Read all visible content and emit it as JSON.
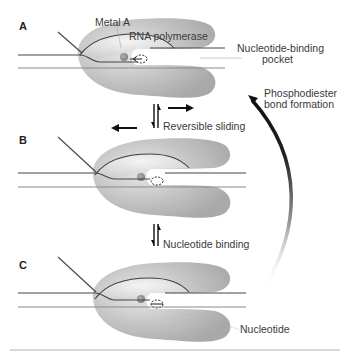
{
  "panels": [
    {
      "letter": "A",
      "state": "pre-translocated"
    },
    {
      "letter": "B",
      "state": "translocated"
    },
    {
      "letter": "C",
      "state": "nucleotide-bound"
    }
  ],
  "labels": {
    "metal_a": "Metal A",
    "rna_polymerase": "RNA polymerase",
    "nucleotide_binding_pocket_line1": "Nucleotide-binding",
    "nucleotide_binding_pocket_line2": "pocket",
    "phosphodiester_line1": "Phosphodiester",
    "phosphodiester_line2": "bond formation",
    "reversible_sliding": "Reversible sliding",
    "nucleotide_binding": "Nucleotide binding",
    "nucleotide": "Nucleotide"
  },
  "colors": {
    "polymerase_fill": "#bdbdbd",
    "polymerase_highlight": "#e6e6e6",
    "strand": "#4a4a4a",
    "metal": "#8f8f8f",
    "arrow": "#111111"
  }
}
